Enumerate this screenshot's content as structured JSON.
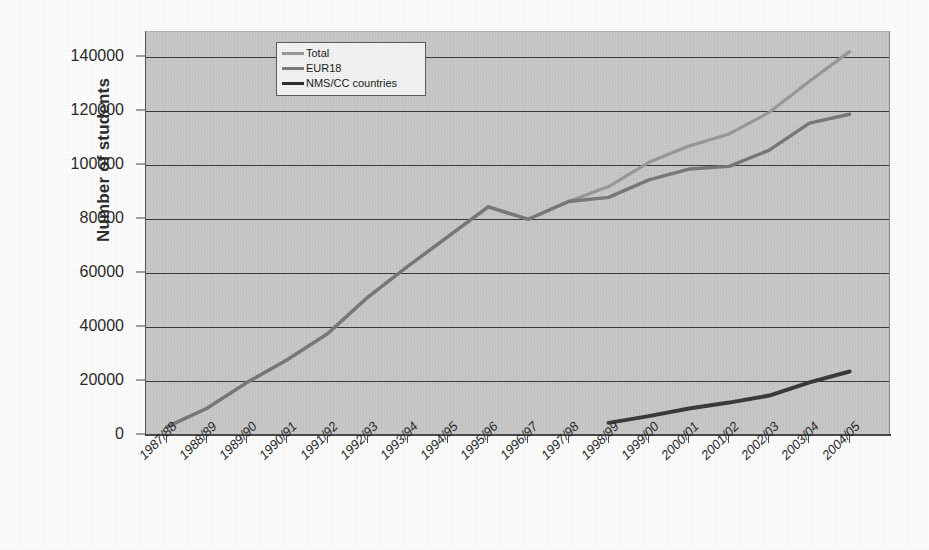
{
  "chart_data": {
    "type": "line",
    "title": "",
    "xlabel": "",
    "ylabel": "Number of students",
    "ylim": [
      0,
      145000
    ],
    "yticks": [
      0,
      20000,
      40000,
      60000,
      80000,
      100000,
      120000,
      140000
    ],
    "ytick_labels": [
      "0",
      "20000",
      "40000",
      "60000",
      "80000",
      "100000",
      "120000",
      "140000"
    ],
    "grid": "horizontal",
    "legend_position": "top-center-inside",
    "categories": [
      "1987/88",
      "1988/89",
      "1989/90",
      "1990/91",
      "1991/92",
      "1992/93",
      "1993/94",
      "1994/95",
      "1995/96",
      "1996/97",
      "1997/98",
      "1998/99",
      "1999/00",
      "2000/01",
      "2001/02",
      "2002/03",
      "2003/04",
      "2004/05"
    ],
    "series": [
      {
        "name": "Total",
        "color": "#9a9a9a",
        "values": [
          3000,
          9900,
          19500,
          27900,
          37500,
          51000,
          62500,
          73500,
          84500,
          79900,
          86500,
          92000,
          101000,
          107000,
          111500,
          119500,
          131000,
          142000
        ]
      },
      {
        "name": "EUR18",
        "color": "#7a7a7a",
        "values": [
          3000,
          9900,
          19500,
          27900,
          37500,
          51000,
          62500,
          73500,
          84500,
          79900,
          86500,
          88000,
          94500,
          98500,
          99500,
          105500,
          115500,
          118800
        ]
      },
      {
        "name": "NMS/CC countries",
        "color": "#3b3b3b",
        "values": [
          null,
          null,
          null,
          null,
          null,
          null,
          null,
          null,
          null,
          null,
          null,
          4500,
          7000,
          9800,
          12000,
          14600,
          19500,
          23500
        ]
      }
    ]
  },
  "legend": {
    "items": [
      {
        "label": "Total",
        "color": "#9a9a9a"
      },
      {
        "label": "EUR18",
        "color": "#7a7a7a"
      },
      {
        "label": "NMS/CC countries",
        "color": "#2f2f2f"
      }
    ]
  },
  "axes": {
    "y_title": "Number of students"
  }
}
